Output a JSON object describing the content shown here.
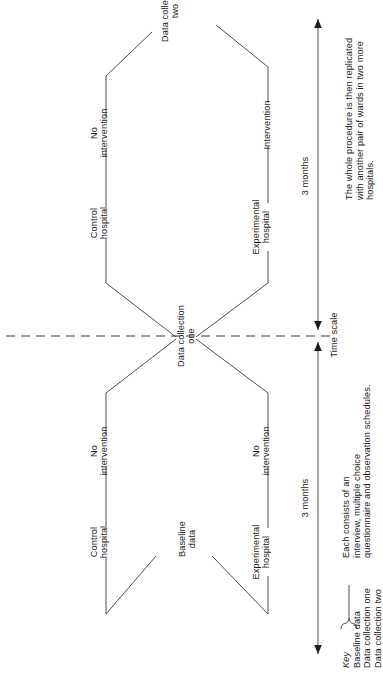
{
  "figure": {
    "type": "study-design-flow-diagram",
    "orientation": "rotated-90-counterclockwise",
    "nodes": {
      "baseline_data": "Baseline\ndata",
      "control_hospital_left": "Control\nhospital",
      "experimental_hospital_left": "Experimental\nhospital",
      "no_intervention_left_top": "No\nintervention",
      "no_intervention_left_bottom": "No\nintervention",
      "data_collection_one": "Data collection\none",
      "control_hospital_right": "Control\nhospital",
      "experimental_hospital_right": "Experimental\nhospital",
      "no_intervention_right_top": "No\nintervention",
      "intervention_right_bottom": "Intervention",
      "data_collection_two": "Data collection\ntwo"
    },
    "timescale": {
      "label": "Time scale",
      "left_duration": "3 months",
      "right_duration": "3 months"
    },
    "note": {
      "line1": "The whole procedure is then replicated",
      "line2": "with another pair of wards in two more",
      "line3": "hospitals."
    },
    "key": {
      "title": "Key",
      "items": [
        "Baseline data",
        "Data collection one",
        "Data collection two"
      ],
      "brace_note": {
        "line1": "Each consists of an",
        "line2": "interview, multiple choice",
        "line3": "questionnaire and observation schedules."
      }
    },
    "colors": {
      "line": "#3a3a3a",
      "text": "#1d1d1d",
      "background": "#ffffff"
    }
  }
}
